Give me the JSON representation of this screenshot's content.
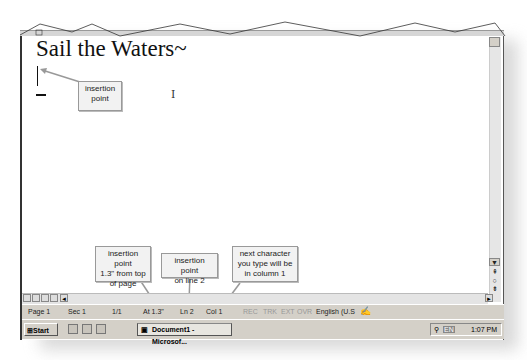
{
  "document": {
    "title_text": "Sail the Waters~",
    "ibeam_glyph": "I"
  },
  "callouts": [
    {
      "id": "insertion-point",
      "text_lines": [
        "insertion",
        "point"
      ]
    },
    {
      "id": "at-position",
      "text_lines": [
        "insertion point",
        "1.3\" from top",
        "of page"
      ]
    },
    {
      "id": "line-number",
      "text_lines": [
        "insertion point",
        "on line 2"
      ]
    },
    {
      "id": "column-number",
      "text_lines": [
        "next character",
        "you type will be",
        "in column 1"
      ]
    }
  ],
  "ruler": {
    "tick_labels": [
      "1",
      "2",
      "3",
      "4",
      "5",
      "6"
    ]
  },
  "scrollbar": {
    "up_arrow": "▲",
    "down_arrow": "▼",
    "prev_page": "⇞",
    "select_browse": "○",
    "next_page": "⇟",
    "right_arrow": "►",
    "left_arrow": "◄"
  },
  "view_buttons": [
    "normal-view",
    "web-layout-view",
    "print-layout-view",
    "outline-view"
  ],
  "statusbar": {
    "page": "Page 1",
    "section": "Sec 1",
    "page_of": "1/1",
    "at": "At 1.3\"",
    "line": "Ln 2",
    "col": "Col 1",
    "rec": "REC",
    "trk": "TRK",
    "ext": "EXT",
    "ovr": "OVR",
    "language": "English (U.S"
  },
  "taskbar": {
    "start_label": "Start",
    "task_button": "Document1 - Microsof...",
    "lang_indicator": "EN",
    "clock": "1:07 PM"
  }
}
